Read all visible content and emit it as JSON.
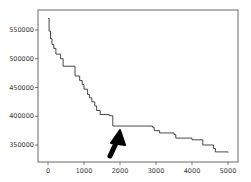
{
  "chart_data": {
    "type": "line",
    "title": "",
    "xlabel": "",
    "ylabel": "",
    "xlim": [
      -250,
      5250
    ],
    "ylim": [
      320000,
      580000
    ],
    "grid": false,
    "legend": null,
    "x_ticks": [
      0,
      1000,
      2000,
      3000,
      4000,
      5000
    ],
    "x_tick_labels": [
      "0",
      "1000",
      "2000",
      "3000",
      "4000",
      "5000"
    ],
    "y_ticks": [
      350000,
      400000,
      450000,
      500000,
      550000
    ],
    "y_tick_labels": [
      "350000",
      "400000",
      "450000",
      "500000",
      "550000"
    ],
    "series": [
      {
        "name": "objective",
        "step": true,
        "color": "#333333",
        "points": [
          [
            0,
            570000
          ],
          [
            30,
            548000
          ],
          [
            70,
            535000
          ],
          [
            110,
            525000
          ],
          [
            160,
            518000
          ],
          [
            220,
            508000
          ],
          [
            350,
            500000
          ],
          [
            420,
            487000
          ],
          [
            700,
            487000
          ],
          [
            750,
            470000
          ],
          [
            880,
            462000
          ],
          [
            950,
            455000
          ],
          [
            1000,
            447000
          ],
          [
            1100,
            438000
          ],
          [
            1150,
            432000
          ],
          [
            1220,
            425000
          ],
          [
            1300,
            418000
          ],
          [
            1350,
            410000
          ],
          [
            1450,
            403000
          ],
          [
            1700,
            401000
          ],
          [
            1800,
            383000
          ],
          [
            2900,
            381000
          ],
          [
            2950,
            375000
          ],
          [
            3100,
            371000
          ],
          [
            3500,
            368000
          ],
          [
            3550,
            362000
          ],
          [
            4000,
            359000
          ],
          [
            4300,
            350000
          ],
          [
            4600,
            344000
          ],
          [
            4650,
            338000
          ],
          [
            5000,
            337000
          ]
        ]
      }
    ],
    "annotations": [
      {
        "type": "arrow",
        "color": "#000000",
        "from": [
          1750,
          327000
        ],
        "to": [
          2000,
          383000
        ],
        "description": "hand-drawn arrow pointing to plateau start"
      }
    ]
  }
}
